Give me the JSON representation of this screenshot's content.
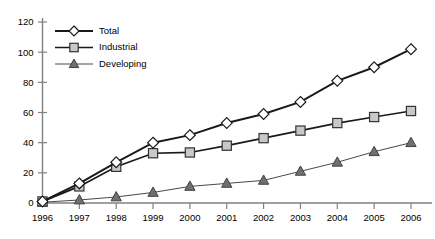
{
  "chart_data": {
    "type": "line",
    "title": "",
    "xlabel": "",
    "ylabel": "",
    "grid": false,
    "legend_position": "top-left",
    "categories": [
      "1996",
      "1997",
      "1998",
      "1999",
      "2000",
      "2001",
      "2002",
      "2003",
      "2004",
      "2005",
      "2006"
    ],
    "x_tick_labels": [
      "1996",
      "1997",
      "1998",
      "1999",
      "2000",
      "2001",
      "2002",
      "2003",
      "2004",
      "2005",
      "2006"
    ],
    "y_tick_labels": [
      "0",
      "20",
      "40",
      "60",
      "80",
      "100",
      "120"
    ],
    "y_ticks": [
      0,
      20,
      40,
      60,
      80,
      100,
      120
    ],
    "ylim": [
      0,
      120
    ],
    "series": [
      {
        "name": "Total",
        "marker": "diamond",
        "marker_fill": "#ffffff",
        "line_color": "#1a1a1a",
        "values": [
          1,
          13,
          27,
          40,
          45,
          53,
          59,
          67,
          81,
          90,
          102
        ]
      },
      {
        "name": "Industrial",
        "marker": "square",
        "marker_fill": "#c8c8c8",
        "line_color": "#1a1a1a",
        "values": [
          1,
          11,
          24,
          33,
          33.5,
          38,
          43,
          48,
          53,
          57,
          61
        ]
      },
      {
        "name": "Developing",
        "marker": "triangle",
        "marker_fill": "#707070",
        "line_color": "#4a4a4a",
        "values": [
          0.5,
          2,
          4,
          7,
          11,
          13,
          15,
          21,
          27,
          34,
          40
        ]
      }
    ],
    "legend": [
      {
        "label": "Total",
        "marker": "diamond"
      },
      {
        "label": "Industrial",
        "marker": "square"
      },
      {
        "label": "Developing",
        "marker": "triangle"
      }
    ]
  }
}
